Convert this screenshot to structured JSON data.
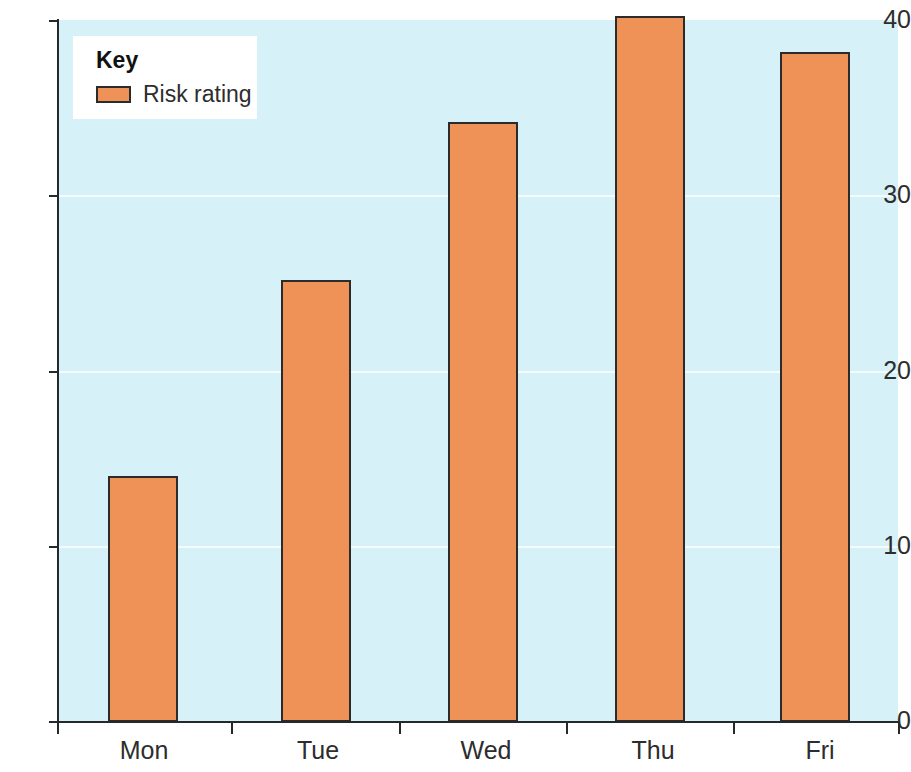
{
  "chart_data": {
    "type": "bar",
    "title": "",
    "xlabel": "",
    "ylabel": "",
    "categories": [
      "Mon",
      "Tue",
      "Wed",
      "Thu",
      "Fri"
    ],
    "values": [
      14,
      25.2,
      34.2,
      40.2,
      38.2
    ],
    "series": [
      {
        "name": "Risk rating",
        "values": [
          14,
          25.2,
          34.2,
          40.2,
          38.2
        ]
      }
    ],
    "ylim": [
      0,
      40
    ],
    "yticks": [
      0,
      10,
      20,
      30,
      40
    ],
    "ytick_labels": [
      "0",
      "10",
      "20",
      "30",
      "40"
    ],
    "grid": true,
    "grid_axis": "y",
    "legend_position": "top-left",
    "legend_title": "Key",
    "legend_entries": [
      {
        "label": "Risk rating",
        "color": "#ee9258"
      }
    ]
  },
  "legend": {
    "title": "Key",
    "entry_label": "Risk rating",
    "swatch_name": "risk-rating-swatch"
  },
  "axes": {
    "y_labels": [
      "40",
      "30",
      "20",
      "10",
      "0"
    ],
    "x_labels": [
      "Mon",
      "Tue",
      "Wed",
      "Thu",
      "Fri"
    ]
  },
  "colors": {
    "plot_background": "#d6f1f7",
    "bar_fill": "#ee9258",
    "bar_border": "#2b2b2b",
    "axis": "#25292b",
    "gridline": "#ffffff",
    "legend_background": "#ffffff",
    "text": "#2d2d2d"
  }
}
